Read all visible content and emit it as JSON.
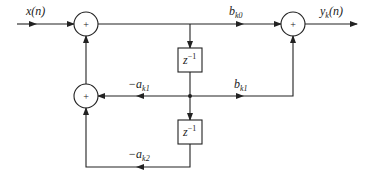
{
  "diagram": {
    "type": "signal-flow block diagram (second-order section)",
    "input_label": "x(n)",
    "output_label": {
      "base": "y",
      "sub": "k",
      "rest": "(n)"
    },
    "adders": [
      {
        "id": "adder-top-left",
        "symbol": "+"
      },
      {
        "id": "adder-mid-left",
        "symbol": "+"
      },
      {
        "id": "adder-top-right",
        "symbol": "+"
      }
    ],
    "delays": [
      {
        "id": "delay-1",
        "base": "z",
        "sup": "−1"
      },
      {
        "id": "delay-2",
        "base": "z",
        "sup": "−1"
      }
    ],
    "gains": [
      {
        "id": "b-k0",
        "base": "b",
        "sub": "k0"
      },
      {
        "id": "b-k1",
        "base": "b",
        "sub": "k1"
      },
      {
        "id": "neg-a-k1",
        "base": "−a",
        "sub": "k1"
      },
      {
        "id": "neg-a-k2",
        "base": "−a",
        "sub": "k2"
      }
    ],
    "colors": {
      "stroke": "#222222",
      "background": "#ffffff"
    }
  }
}
